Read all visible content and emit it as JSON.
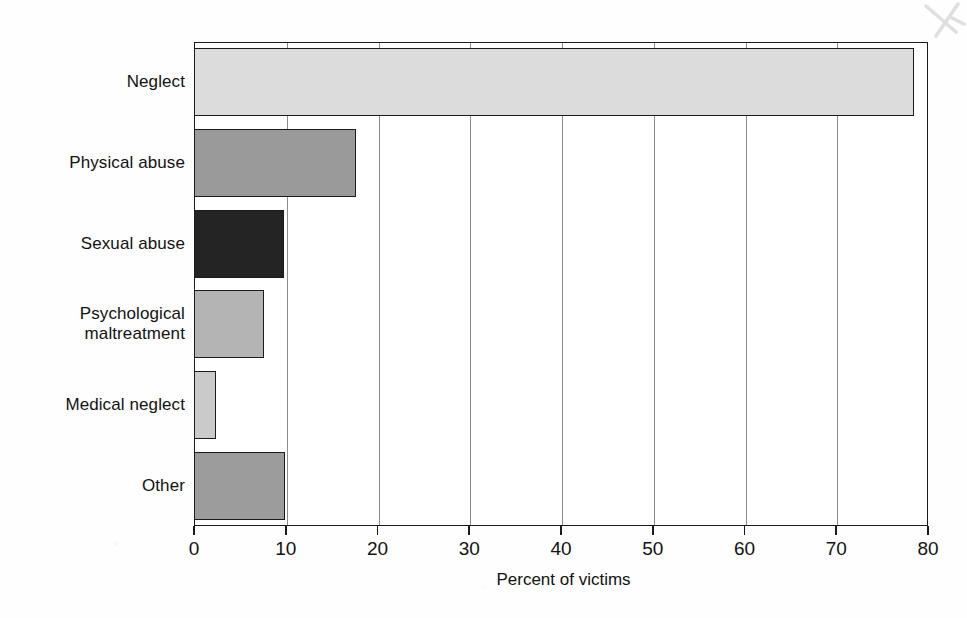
{
  "chart_data": {
    "type": "bar",
    "orientation": "horizontal",
    "title": "",
    "xlabel": "Percent of victims",
    "ylabel": "",
    "xlim": [
      0,
      80
    ],
    "xticks": [
      0,
      10,
      20,
      30,
      40,
      50,
      60,
      70,
      80
    ],
    "grid": "vertical",
    "legend": "none",
    "categories": [
      "Neglect",
      "Physical abuse",
      "Sexual abuse",
      "Psychological\nmaltreatment",
      "Medical neglect",
      "Other"
    ],
    "values": [
      78.5,
      17.7,
      9.8,
      7.6,
      2.4,
      9.9
    ],
    "bar_colors": [
      "#dcdcdc",
      "#9a9a9a",
      "#242424",
      "#b4b4b4",
      "#cacaca",
      "#9c9c9c"
    ],
    "bar_edge_color": "#1b1b1b",
    "axis_color": "#1b1b1b",
    "gridline_color": "#8c8c8c",
    "background_color": "#ffffff"
  },
  "annotations": {
    "scan_mark": "pencil-check-mark"
  }
}
